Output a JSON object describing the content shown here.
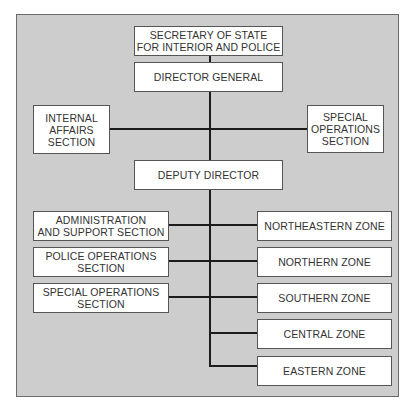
{
  "chart": {
    "type": "organization-chart",
    "top": {
      "secretary": "SECRETARY OF STATE\nFOR INTERIOR AND POLICE",
      "director_general": "DIRECTOR GENERAL"
    },
    "staff_units": [
      {
        "label": "INTERNAL\nAFFAIRS\nSECTION",
        "side": "left"
      },
      {
        "label": "SPECIAL\nOPERATIONS\nSECTION",
        "side": "right"
      }
    ],
    "deputy_director": "DEPUTY DIRECTOR",
    "sections": [
      "ADMINISTRATION\nAND SUPPORT SECTION",
      "POLICE OPERATIONS\nSECTION",
      "SPECIAL OPERATIONS\nSECTION"
    ],
    "zones": [
      "NORTHEASTERN ZONE",
      "NORTHERN ZONE",
      "SOUTHERN ZONE",
      "CENTRAL ZONE",
      "EASTERN ZONE"
    ]
  },
  "colors": {
    "panel_background": "#cdcdcd",
    "box_background": "#ffffff",
    "line_color": "#1c1c1c",
    "text_color": "#333333"
  }
}
